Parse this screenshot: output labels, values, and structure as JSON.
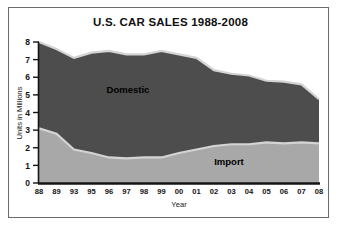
{
  "figure": {
    "title": "U.S. CAR SALES 1988-2008",
    "background": "#ffffff",
    "frame_color": "#6b6b6b"
  },
  "axes": {
    "y_axis_label": "Units in Millions",
    "x_axis_label": "Year",
    "y_ticks": [
      "0",
      "1",
      "2",
      "3",
      "4",
      "5",
      "6",
      "7",
      "8"
    ],
    "x_ticks": [
      "88",
      "89",
      "93",
      "95",
      "96",
      "97",
      "98",
      "99",
      "00",
      "01",
      "02",
      "03",
      "04",
      "05",
      "06",
      "07",
      "08"
    ]
  },
  "legend": {
    "domestic_label": "Domestic",
    "import_label": "Import"
  },
  "chart_data": {
    "type": "area",
    "stacked": true,
    "title": "U.S. CAR SALES 1988-2008",
    "xlabel": "Year",
    "ylabel": "Units in Millions",
    "ylim": [
      0,
      8
    ],
    "grid": false,
    "legend_position": "inline-annotations",
    "categories": [
      "88",
      "89",
      "93",
      "95",
      "96",
      "97",
      "98",
      "99",
      "00",
      "01",
      "02",
      "03",
      "04",
      "05",
      "06",
      "07",
      "08"
    ],
    "series": [
      {
        "name": "Import",
        "color": "#a8a8a8",
        "values": [
          3.1,
          2.8,
          1.9,
          1.7,
          1.45,
          1.4,
          1.45,
          1.45,
          1.7,
          1.9,
          2.1,
          2.2,
          2.2,
          2.3,
          2.25,
          2.3,
          2.25
        ]
      },
      {
        "name": "Domestic",
        "color": "#4d4d4d",
        "values": [
          4.9,
          4.8,
          5.2,
          5.7,
          6.05,
          5.9,
          5.85,
          6.05,
          5.6,
          5.2,
          4.3,
          4.0,
          3.9,
          3.5,
          3.5,
          3.3,
          2.5
        ]
      }
    ],
    "totals": [
      8.0,
      7.6,
      7.1,
      7.4,
      7.5,
      7.3,
      7.3,
      7.5,
      7.3,
      7.1,
      6.4,
      6.2,
      6.1,
      5.8,
      5.75,
      5.6,
      4.75
    ]
  }
}
